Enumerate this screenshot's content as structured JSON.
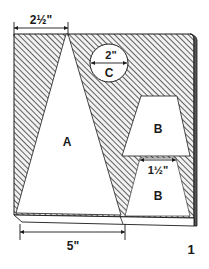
{
  "figure": {
    "number": "1",
    "colors": {
      "ink": "#1a1a1a",
      "paper": "#ffffff",
      "hatch": "#3a3a3a"
    }
  },
  "pieces": {
    "a": {
      "label": "A"
    },
    "b_upper": {
      "label": "B"
    },
    "b_lower": {
      "label": "B"
    },
    "c": {
      "label": "C",
      "diameter": "2\""
    }
  },
  "dimensions": {
    "top_width": "2½\"",
    "bottom_width": "5\"",
    "b_width": "1½\"",
    "c_diameter": "2\""
  }
}
